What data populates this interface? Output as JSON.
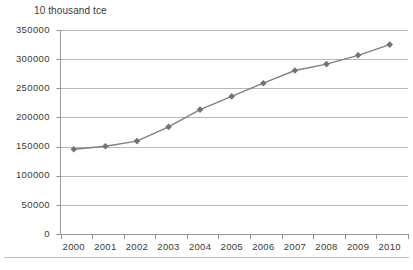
{
  "chart_data": {
    "type": "line",
    "title": "10 thousand tce",
    "subtitle": "",
    "xlabel": "",
    "ylabel": "10 thousand tce",
    "categories": [
      "2000",
      "2001",
      "2002",
      "2003",
      "2004",
      "2005",
      "2006",
      "2007",
      "2008",
      "2009",
      "2010"
    ],
    "values": [
      145531,
      150406,
      159431,
      183792,
      213456,
      235997,
      258676,
      280508,
      291448,
      306647,
      324939
    ],
    "series": [
      {
        "name": "Energy consumption",
        "values": [
          145531,
          150406,
          159431,
          183792,
          213456,
          235997,
          258676,
          280508,
          291448,
          306647,
          324939
        ]
      }
    ],
    "ylim": [
      0,
      350000
    ],
    "yticks": [
      0,
      50000,
      100000,
      150000,
      200000,
      250000,
      300000,
      350000
    ],
    "ytick_labels": [
      "0",
      "50000",
      "100000",
      "150000",
      "200000",
      "250000",
      "300000",
      "350000"
    ],
    "xtick_labels": [
      "2000",
      "2001",
      "2002",
      "2003",
      "2004",
      "2005",
      "2006",
      "2007",
      "2008",
      "2009",
      "2010"
    ],
    "grid": true,
    "grid_axis": "y",
    "legend": false,
    "legend_position": "none",
    "marker": "diamond",
    "line_color": "#808080",
    "marker_color": "#737373",
    "grid_color": "#a6a6a6",
    "axis_color": "#909090",
    "text_color": "#3a3a3a",
    "background": "#ffffff",
    "annotations": []
  },
  "labels": {
    "y": [
      "350000",
      "300000",
      "250000",
      "200000",
      "150000",
      "100000",
      "50000",
      "0"
    ],
    "x": [
      "2000",
      "2001",
      "2002",
      "2003",
      "2004",
      "2005",
      "2006",
      "2007",
      "2008",
      "2009",
      "2010"
    ],
    "unit_title": "10 thousand tce"
  }
}
